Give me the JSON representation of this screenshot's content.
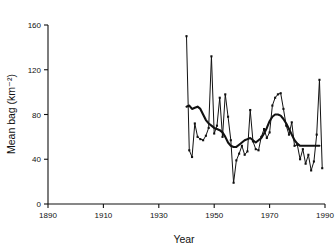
{
  "chart_data": {
    "type": "line",
    "title": "",
    "xlabel": "Year",
    "ylabel": "Mean bag (km⁻²)",
    "xlim": [
      1890,
      1990
    ],
    "ylim": [
      0,
      160
    ],
    "xticks": [
      1890,
      1910,
      1930,
      1950,
      1970,
      1990
    ],
    "xtick_labels": [
      "1890",
      "1910",
      "1930",
      "1950",
      "1970",
      "1990"
    ],
    "yticks": [
      0,
      40,
      80,
      120,
      160
    ],
    "ytick_labels": [
      "0",
      "40",
      "80",
      "120",
      "160"
    ],
    "grid": false,
    "legend": null,
    "series": [
      {
        "name": "Annual mean bag",
        "style": "thin line with point markers",
        "markers": true,
        "x": [
          1940,
          1941,
          1942,
          1943,
          1944,
          1945,
          1946,
          1947,
          1948,
          1949,
          1950,
          1951,
          1952,
          1953,
          1954,
          1955,
          1956,
          1957,
          1958,
          1959,
          1960,
          1961,
          1962,
          1963,
          1964,
          1965,
          1966,
          1967,
          1968,
          1969,
          1970,
          1971,
          1972,
          1973,
          1974,
          1975,
          1976,
          1977,
          1978,
          1979,
          1980,
          1981,
          1982,
          1983,
          1984,
          1985,
          1986,
          1987,
          1988,
          1989
        ],
        "values": [
          150,
          48,
          42,
          72,
          60,
          58,
          57,
          61,
          68,
          132,
          63,
          70,
          95,
          60,
          98,
          78,
          57,
          19,
          39,
          45,
          52,
          44,
          47,
          84,
          56,
          49,
          48,
          60,
          67,
          59,
          64,
          88,
          95,
          98,
          99,
          85,
          70,
          62,
          73,
          52,
          53,
          40,
          49,
          36,
          44,
          30,
          38,
          62,
          111,
          32
        ]
      },
      {
        "name": "Smoothed trend",
        "style": "thick line",
        "markers": false,
        "x": [
          1940,
          1941,
          1942,
          1943,
          1944,
          1945,
          1946,
          1947,
          1948,
          1949,
          1950,
          1951,
          1952,
          1953,
          1954,
          1955,
          1956,
          1957,
          1958,
          1959,
          1960,
          1961,
          1962,
          1963,
          1964,
          1965,
          1966,
          1967,
          1968,
          1969,
          1970,
          1971,
          1972,
          1973,
          1974,
          1975,
          1976,
          1977,
          1978,
          1979,
          1980,
          1981,
          1982,
          1983,
          1984,
          1985,
          1986,
          1987,
          1988
        ],
        "values": [
          87,
          88,
          85,
          86,
          87,
          85,
          80,
          75,
          72,
          70,
          68,
          67,
          66,
          64,
          60,
          55,
          52,
          51,
          51,
          53,
          55,
          57,
          58,
          59,
          57,
          55,
          57,
          59,
          63,
          68,
          74,
          78,
          80,
          80,
          79,
          76,
          72,
          67,
          62,
          57,
          54,
          52,
          52,
          52,
          52,
          52,
          52,
          52,
          52
        ]
      }
    ]
  },
  "figure": {
    "name": "mean-bag-vs-year-chart",
    "background": "#ffffff",
    "foreground": "#111111"
  }
}
